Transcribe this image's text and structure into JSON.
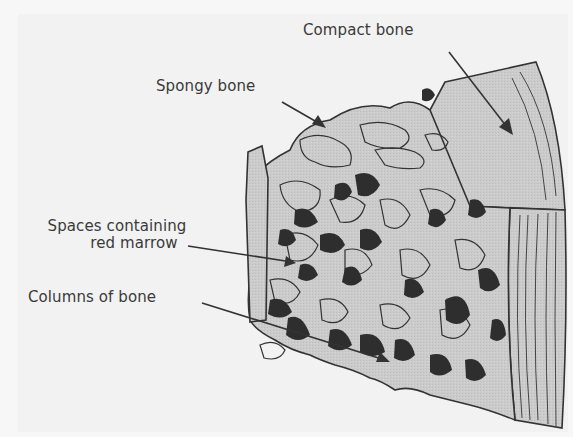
{
  "diagram": {
    "labels": {
      "compact_bone": "Compact bone",
      "spongy_bone": "Spongy bone",
      "spaces_line1": "Spaces containing",
      "spaces_line2": "red marrow",
      "columns_of_bone": "Columns of bone"
    },
    "colors": {
      "background": "#f2f2f2",
      "bone_fill": "#c9c9c9",
      "marrow_fill": "#2e2e2e",
      "outline": "#333333",
      "text": "#3a3a3a"
    }
  }
}
